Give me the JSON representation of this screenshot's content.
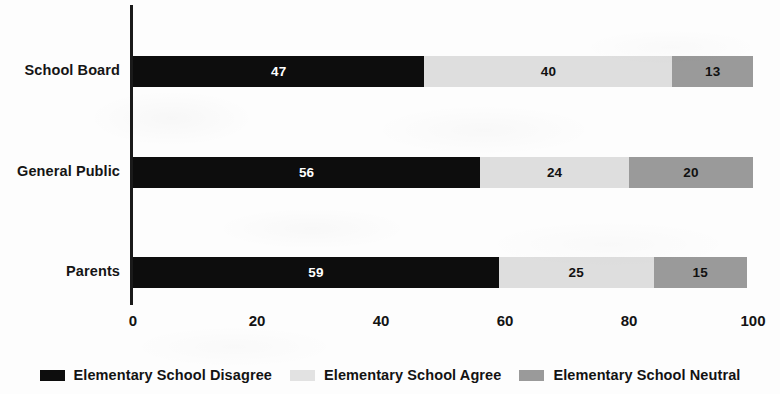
{
  "chart_data": {
    "type": "bar",
    "orientation": "horizontal",
    "stacked": true,
    "title": "",
    "subtitle": "",
    "xlabel": "",
    "ylabel": "",
    "xlim": [
      0,
      100
    ],
    "xticks": [
      0,
      20,
      40,
      60,
      80,
      100
    ],
    "xtick_labels": [
      "0",
      "20",
      "40",
      "60",
      "80",
      "100"
    ],
    "grid": false,
    "legend_position": "bottom",
    "categories": [
      "School Board",
      "General Public",
      "Parents"
    ],
    "series": [
      {
        "name": "Elementary School Disagree",
        "color": "#0d0d0d",
        "values": [
          47,
          56,
          59
        ],
        "labels": [
          "47",
          "56",
          "59"
        ]
      },
      {
        "name": "Elementary School Agree",
        "color": "#dedede",
        "values": [
          40,
          24,
          25
        ],
        "labels": [
          "40",
          "24",
          "25"
        ]
      },
      {
        "name": "Elementary School Neutral",
        "color": "#9a9a9a",
        "values": [
          13,
          20,
          15
        ],
        "labels": [
          "13",
          "20",
          "15"
        ]
      }
    ]
  }
}
